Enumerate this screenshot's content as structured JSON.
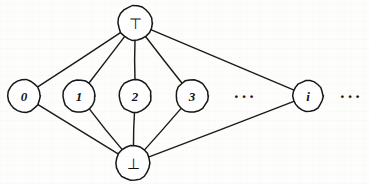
{
  "figure": {
    "background_color": "#fdfdfc",
    "ink_color": "#171717",
    "width": 369,
    "height": 184
  },
  "nodes": [
    {
      "id": "top",
      "label": "⊤",
      "label_kind": "sym",
      "x": 135,
      "y": 23,
      "r": 17,
      "name": "node-top"
    },
    {
      "id": "n0",
      "label": "0",
      "label_kind": "num",
      "x": 24,
      "y": 96,
      "r": 16,
      "name": "node-0"
    },
    {
      "id": "n1",
      "label": "1",
      "label_kind": "num",
      "x": 79,
      "y": 96,
      "r": 16,
      "name": "node-1"
    },
    {
      "id": "n2",
      "label": "2",
      "label_kind": "num",
      "x": 135,
      "y": 96,
      "r": 16,
      "name": "node-2"
    },
    {
      "id": "n3",
      "label": "3",
      "label_kind": "num",
      "x": 192,
      "y": 96,
      "r": 16,
      "name": "node-3"
    },
    {
      "id": "ni",
      "label": "i",
      "label_kind": "num",
      "x": 308,
      "y": 96,
      "r": 15,
      "name": "node-i"
    },
    {
      "id": "bottom",
      "label": "⊥",
      "label_kind": "sym",
      "x": 133,
      "y": 163,
      "r": 17,
      "name": "node-bottom"
    }
  ],
  "ellipses": [
    {
      "id": "mid-ellipsis",
      "label": "···",
      "x": 245,
      "y": 96,
      "name": "ellipsis-middle"
    },
    {
      "id": "right-ellipsis",
      "label": "···",
      "x": 351,
      "y": 96,
      "name": "ellipsis-right"
    }
  ],
  "edges": [
    {
      "from": "top",
      "to": "n0",
      "name": "edge-top-0"
    },
    {
      "from": "top",
      "to": "n1",
      "name": "edge-top-1"
    },
    {
      "from": "top",
      "to": "n2",
      "name": "edge-top-2"
    },
    {
      "from": "top",
      "to": "n3",
      "name": "edge-top-3"
    },
    {
      "from": "top",
      "to": "ni",
      "name": "edge-top-i"
    },
    {
      "from": "bottom",
      "to": "n0",
      "name": "edge-bottom-0"
    },
    {
      "from": "bottom",
      "to": "n1",
      "name": "edge-bottom-1"
    },
    {
      "from": "bottom",
      "to": "n2",
      "name": "edge-bottom-2"
    },
    {
      "from": "bottom",
      "to": "n3",
      "name": "edge-bottom-3"
    },
    {
      "from": "bottom",
      "to": "ni",
      "name": "edge-bottom-i"
    }
  ]
}
